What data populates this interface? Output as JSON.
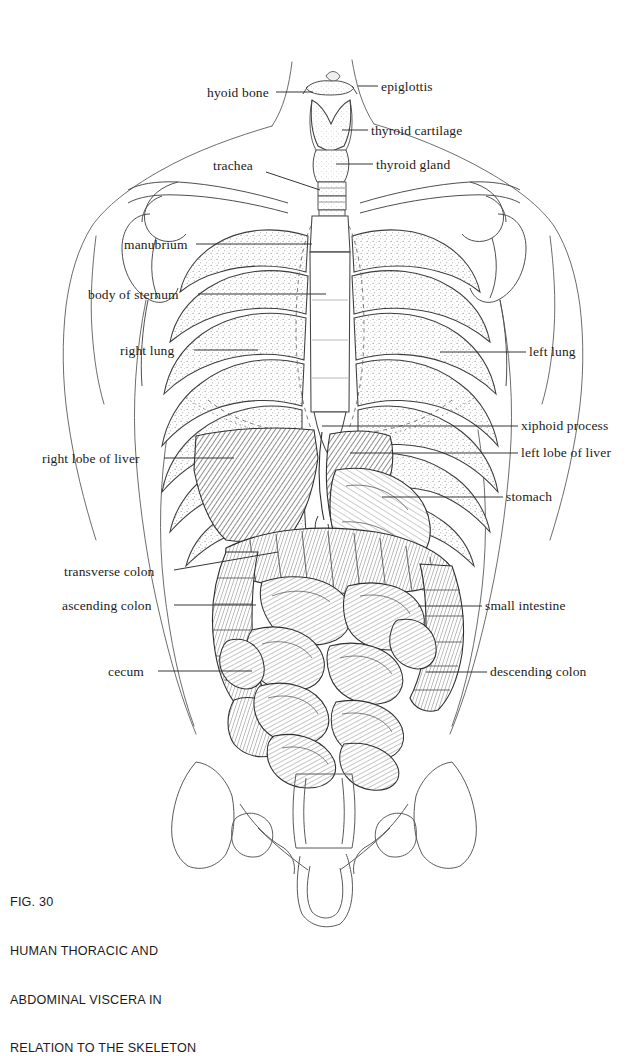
{
  "figure": {
    "number": "FIG. 30",
    "caption_lines": [
      "FIG. 30",
      "HUMAN THORACIC AND",
      "ABDOMINAL VISCERA IN",
      "RELATION TO THE SKELETON"
    ],
    "title": "HUMAN THORACIC AND ABDOMINAL VISCERA IN RELATION TO THE SKELETON",
    "style": "pen-and-ink anatomical line drawing",
    "background_color": "#ffffff",
    "ink_color": "#1b1b1b"
  },
  "labels": {
    "left": [
      {
        "id": "hyoid-bone",
        "text": "hyoid bone",
        "text_x": 207,
        "text_y": 96,
        "line_x1": 276,
        "line_x2": 313,
        "line_y": 96
      },
      {
        "id": "trachea",
        "text": "trachea",
        "text_x": 213,
        "text_y": 169,
        "line_x1": 264,
        "line_x2": 318,
        "line_y": 176
      },
      {
        "id": "manubrium",
        "text": "manubrium",
        "text_x": 124,
        "text_y": 248,
        "line_x1": 196,
        "line_x2": 310,
        "line_y": 248
      },
      {
        "id": "body-of-sternum",
        "text": "body of sternum",
        "text_x": 88,
        "text_y": 297,
        "line_x1": 196,
        "line_x2": 322,
        "line_y": 297
      },
      {
        "id": "right-lung",
        "text": "right lung",
        "text_x": 120,
        "text_y": 353,
        "line_x1": 192,
        "line_x2": 256,
        "line_y": 353
      },
      {
        "id": "right-lobe-of-liver",
        "text": "right lobe of liver",
        "text_x": 42,
        "text_y": 461,
        "line_x1": 162,
        "line_x2": 230,
        "line_y": 461
      },
      {
        "id": "transverse-colon",
        "text": "transverse colon",
        "text_x": 64,
        "text_y": 575,
        "line_x1": 172,
        "line_x2": 272,
        "line_y": 572
      },
      {
        "id": "ascending-colon",
        "text": "ascending colon",
        "text_x": 62,
        "text_y": 608,
        "line_x1": 172,
        "line_x2": 258,
        "line_y": 608
      },
      {
        "id": "cecum",
        "text": "cecum",
        "text_x": 108,
        "text_y": 674,
        "line_x1": 156,
        "line_x2": 254,
        "line_y": 674
      }
    ],
    "right": [
      {
        "id": "epiglottis",
        "text": "epiglottis",
        "text_x": 381,
        "text_y": 90,
        "line_x1": 358,
        "line_x2": 377,
        "line_y": 90
      },
      {
        "id": "thyroid-cartilage",
        "text": "thyroid cartilage",
        "text_x": 371,
        "text_y": 134,
        "line_x1": 344,
        "line_x2": 367,
        "line_y": 134
      },
      {
        "id": "thyroid-gland",
        "text": "thyroid gland",
        "text_x": 376,
        "text_y": 168,
        "line_x1": 338,
        "line_x2": 372,
        "line_y": 168
      },
      {
        "id": "left-lung",
        "text": "left lung",
        "text_x": 529,
        "text_y": 355,
        "line_x1": 438,
        "line_x2": 524,
        "line_y": 355
      },
      {
        "id": "xiphoid-process",
        "text": "xiphoid process",
        "text_x": 521,
        "text_y": 429,
        "line_x1": 320,
        "line_x2": 516,
        "line_y": 429
      },
      {
        "id": "left-lobe-of-liver",
        "text": "left lobe of liver",
        "text_x": 521,
        "text_y": 456,
        "line_x1": 348,
        "line_x2": 516,
        "line_y": 456
      },
      {
        "id": "stomach",
        "text": "stomach",
        "text_x": 506,
        "text_y": 500,
        "line_x1": 380,
        "line_x2": 501,
        "line_y": 500
      },
      {
        "id": "small-intestine",
        "text": "small intestine",
        "text_x": 485,
        "text_y": 609,
        "line_x1": 420,
        "line_x2": 480,
        "line_y": 609
      },
      {
        "id": "descending-colon",
        "text": "descending colon",
        "text_x": 490,
        "text_y": 675,
        "line_x1": 428,
        "line_x2": 485,
        "line_y": 675
      }
    ]
  },
  "anatomy": {
    "structures": [
      "hyoid bone",
      "epiglottis",
      "thyroid cartilage",
      "thyroid gland",
      "trachea",
      "clavicle",
      "scapula",
      "humerus",
      "manubrium",
      "body of sternum",
      "xiphoid process",
      "ribs",
      "costal cartilage",
      "right lung",
      "left lung",
      "right lobe of liver",
      "left lobe of liver",
      "stomach",
      "transverse colon",
      "ascending colon",
      "descending colon",
      "cecum",
      "small intestine",
      "ilium",
      "sacrum",
      "pubis",
      "femur head"
    ]
  }
}
